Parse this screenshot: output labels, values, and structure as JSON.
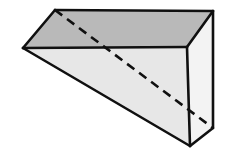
{
  "figure": {
    "name": "triangular-prism",
    "canvas": {
      "width": 231,
      "height": 150,
      "background": "#ffffff"
    },
    "style": {
      "stroke_color": "#101010",
      "stroke_width": 2.6,
      "hidden_edge_color": "#101010",
      "hidden_edge_width": 2.6,
      "hidden_edge_dash": "9 6",
      "top_face_fill": "#b9b9b9",
      "front_face_fill": "#e7e7e7",
      "right_face_fill": "#f3f3f3"
    },
    "vertices": {
      "A": {
        "label": "front-left-apex",
        "x": 23,
        "y": 48
      },
      "B": {
        "label": "top-back-left-apex",
        "x": 55,
        "y": 10
      },
      "C": {
        "label": "top-back-right",
        "x": 213,
        "y": 11
      },
      "D": {
        "label": "front-top-right",
        "x": 187,
        "y": 47
      },
      "E": {
        "label": "front-bottom",
        "x": 190,
        "y": 146
      },
      "F": {
        "label": "back-bottom-right",
        "x": 213,
        "y": 128
      }
    },
    "faces": [
      {
        "name": "top-face",
        "fill": "#b9b9b9",
        "points": "23,48 55,10 213,11 187,47"
      },
      {
        "name": "front-face",
        "fill": "#e7e7e7",
        "points": "23,48 187,47 190,146"
      },
      {
        "name": "right-face",
        "fill": "#f3f3f3",
        "points": "187,47 213,11 213,128 190,146"
      }
    ],
    "visible_edges": [
      {
        "name": "edge-top-left-front",
        "x1": 23,
        "y1": 48,
        "x2": 55,
        "y2": 10
      },
      {
        "name": "edge-top-back",
        "x1": 55,
        "y1": 10,
        "x2": 213,
        "y2": 11
      },
      {
        "name": "edge-top-right-slant",
        "x1": 213,
        "y1": 11,
        "x2": 187,
        "y2": 47
      },
      {
        "name": "edge-front-top",
        "x1": 23,
        "y1": 48,
        "x2": 187,
        "y2": 47
      },
      {
        "name": "edge-front-hypotenuse",
        "x1": 23,
        "y1": 48,
        "x2": 190,
        "y2": 146
      },
      {
        "name": "edge-front-right-vertical",
        "x1": 187,
        "y1": 47,
        "x2": 190,
        "y2": 146
      },
      {
        "name": "edge-right-back-vertical",
        "x1": 213,
        "y1": 11,
        "x2": 213,
        "y2": 128
      },
      {
        "name": "edge-bottom-right-slant",
        "x1": 190,
        "y1": 146,
        "x2": 213,
        "y2": 128
      }
    ],
    "hidden_edges": [
      {
        "name": "edge-hidden-diagonal",
        "x1": 55,
        "y1": 10,
        "x2": 213,
        "y2": 128
      }
    ]
  }
}
